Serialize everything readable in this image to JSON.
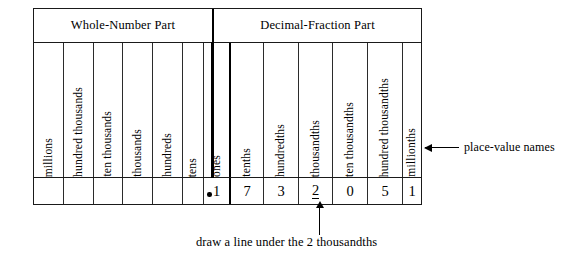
{
  "chart_data": {
    "type": "table",
    "group_headers": [
      {
        "label": "Whole-Number Part",
        "span": 7
      },
      {
        "label": "Decimal-Fraction Part",
        "span": 6
      }
    ],
    "place_value_names": [
      "millions",
      "hundred thousands",
      "ten thousands",
      "thousands",
      "hundreds",
      "tens",
      "ones",
      "tenths",
      "hundredths",
      "thousandths",
      "ten thousandths",
      "hundred thousandths",
      "millionths"
    ],
    "digits": [
      "",
      "",
      "",
      "",
      "",
      "",
      "1",
      "7",
      "3",
      "2",
      "0",
      "5",
      "1"
    ],
    "decimal_point": ".",
    "decimal_point_after_index": 6,
    "underlined_index": 9,
    "number_shown": "1.732051",
    "annotations": {
      "right": "place-value names",
      "bottom": "draw a line under the 2 thousandths"
    }
  },
  "colors": {
    "ink": "#000000",
    "rule": "#2b2b2b",
    "background": "#ffffff"
  }
}
